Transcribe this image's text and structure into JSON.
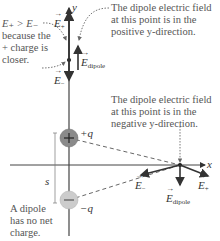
{
  "axes": {
    "y_label": "y",
    "x_label": "x"
  },
  "charges": {
    "positive": {
      "label": "+q",
      "symbol": "+",
      "color": "#8a8a8a"
    },
    "negative": {
      "label": "−q",
      "symbol": "−",
      "color": "#c8c8c8"
    }
  },
  "separation_label": "s",
  "top_point": {
    "e_plus": "E",
    "e_plus_sub": "+",
    "e_minus": "E",
    "e_minus_sub": "−",
    "e_dipole": "E",
    "e_dipole_sub": "dipole"
  },
  "side_point": {
    "e_plus": "E",
    "e_plus_sub": "+",
    "e_minus": "E",
    "e_minus_sub": "−",
    "e_dipole": "E",
    "e_dipole_sub": "dipole"
  },
  "annotations": {
    "comparison": [
      "E₊ > E₋",
      "because the",
      "+ charge is",
      "closer."
    ],
    "positive_direction": [
      "The dipole electric field",
      "at this point is in the",
      "positive y-direction."
    ],
    "negative_direction": [
      "The dipole electric field",
      "at this point is in the",
      "negative y-direction."
    ],
    "no_net_charge": [
      "A dipole",
      "has no net",
      "charge."
    ]
  },
  "colors": {
    "axis": "#444444",
    "vector": "#333333",
    "annotation_text": "#555555",
    "dotted_arrow": "#666666"
  }
}
